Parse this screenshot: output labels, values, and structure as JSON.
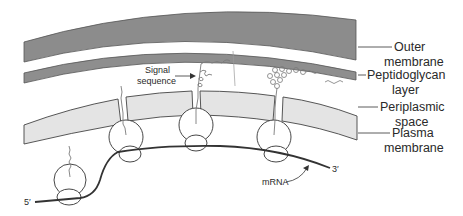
{
  "diagram": {
    "type": "biological-cross-section",
    "layers": [
      {
        "id": "outer",
        "label_line1": "Outer",
        "label_line2": "membrane",
        "color": "#8c8c8c"
      },
      {
        "id": "peptidoglycan",
        "label_line1": "Peptidoglycan",
        "label_line2": "layer",
        "color": "#8e8e8e"
      },
      {
        "id": "periplasmic",
        "label_line1": "Periplasmic",
        "label_line2": "space",
        "color": "#ffffff"
      },
      {
        "id": "plasma",
        "label_line1": "Plasma",
        "label_line2": "membrane",
        "color": "#e4e4e4"
      }
    ],
    "annotations": {
      "signal_line1": "Signal",
      "signal_line2": "sequence",
      "mrna": "mRNA",
      "five_prime": "5′",
      "three_prime": "3′"
    },
    "ribosome_count": 4,
    "colors": {
      "stroke": "#333333",
      "text": "#2a2a2a",
      "peptide": "#7a7a7a"
    }
  }
}
